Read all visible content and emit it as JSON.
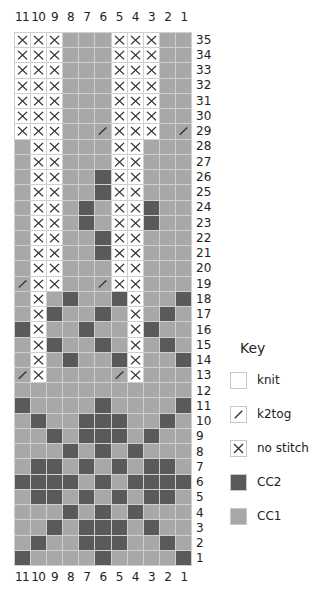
{
  "chart_data": {
    "type": "table",
    "columns": [
      "11",
      "10",
      "9",
      "8",
      "7",
      "6",
      "5",
      "4",
      "3",
      "2",
      "1"
    ],
    "rows_top_to_bottom": [
      "35",
      "34",
      "33",
      "32",
      "31",
      "30",
      "29",
      "28",
      "27",
      "26",
      "25",
      "24",
      "23",
      "22",
      "21",
      "20",
      "19",
      "18",
      "17",
      "16",
      "15",
      "14",
      "13",
      "12",
      "11",
      "10",
      "9",
      "8",
      "7",
      "6",
      "5",
      "4",
      "3",
      "2",
      "1"
    ],
    "symbol_codes": {
      "K": "knit",
      "T": "k2tog",
      "X": "no stitch",
      "D": "CC2",
      "L": "CC1"
    },
    "grid": [
      "XXXLLLXXXLL",
      "XXXLLLXXXLL",
      "XXXLLLXXXLL",
      "XXXLLLXXXLL",
      "XXXLLLXXXLL",
      "XXXLLLXXXLL",
      "XXXLLTXXXLT",
      "LXXLLLXXLLL",
      "LXXLLLXXLLL",
      "LXXLLDXXLLL",
      "LXXLLDXXLLL",
      "LXXLDLXXDLL",
      "LXXLDLXXDLL",
      "LXXLLDXXLLL",
      "LXXLLDXXLLL",
      "LXXLLLXXLLL",
      "TXXLLTXXLLL",
      "LXLDLLDXLLD",
      "LXDLLDLXLDL",
      "DXLLDLLXDLL",
      "LXDLLDLXLDL",
      "LXLDLLDXLLD",
      "TXLLLLTXLLL",
      "LLLLLLLLLLL",
      "DLLLLDLLLLD",
      "LDLLDDDLLDL",
      "LLDLDDDLDLL",
      "LLLDLDLDLLL",
      "LDDLDLDLDDL",
      "DDDDLDLDDDD",
      "LDDLDLDLDDL",
      "LLLDLDLDLLL",
      "LLDLDDDLDLL",
      "LDLLDDDLLDL",
      "DLLLLDLLLLD"
    ],
    "colors": {
      "CC1": "#a8a8a8",
      "CC2": "#5a5a5a",
      "knit": "#ffffff",
      "gridline": "#cfcfcf"
    }
  },
  "key": {
    "title": "Key",
    "items": [
      {
        "symbol": "K",
        "label": "knit"
      },
      {
        "symbol": "T",
        "label": "k2tog"
      },
      {
        "symbol": "X",
        "label": "no stitch"
      },
      {
        "symbol": "D",
        "label": "CC2"
      },
      {
        "symbol": "L",
        "label": "CC1"
      }
    ]
  }
}
